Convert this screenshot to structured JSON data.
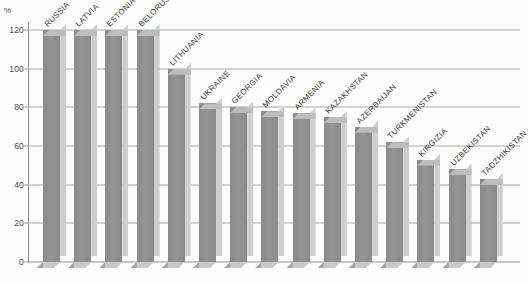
{
  "chart": {
    "unit_label": "%",
    "y_ticks": [
      "0",
      "20",
      "40",
      "60",
      "80",
      "100",
      "120"
    ]
  },
  "chart_data": {
    "type": "bar",
    "title": "",
    "subtitle": "",
    "xlabel": "",
    "ylabel": "%",
    "ylim": [
      0,
      120
    ],
    "yticks": [
      0,
      20,
      40,
      60,
      80,
      100,
      120
    ],
    "grid": true,
    "legend": "none",
    "orientation": "vertical",
    "style": "3d-extruded-gray-bars",
    "categories": [
      "RUSSIA",
      "LATVIA",
      "ESTONIA",
      "BELORUSSIA",
      "LITHUANIA",
      "UKRAINE",
      "GEORGIA",
      "MOLDAVIA",
      "ARMENIA",
      "KAZAKHSTAN",
      "AZERBAIJAN",
      "TURKMENISTAN",
      "KIRGIZIA",
      "UZBEKISTAN",
      "TADZHIKISTAN"
    ],
    "values": [
      120,
      120,
      120,
      120,
      100,
      82,
      80,
      78,
      77,
      75,
      70,
      62,
      53,
      48,
      43
    ]
  }
}
